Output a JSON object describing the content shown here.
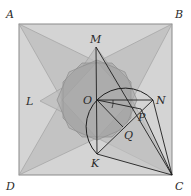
{
  "diagram": {
    "type": "geometry",
    "colors": {
      "square_fill": "#cfcfcf",
      "square_stroke": "#8a8a8a",
      "star_fill": "#b8b8b8",
      "octagon_fill": "#9e9e9e",
      "line": "#1e1e1e",
      "thin_line": "#7a7a7a"
    },
    "points": {
      "A": {
        "label": "A",
        "x": 19,
        "y": 24
      },
      "B": {
        "label": "B",
        "x": 172,
        "y": 24
      },
      "C": {
        "label": "C",
        "x": 172,
        "y": 175
      },
      "D": {
        "label": "D",
        "x": 19,
        "y": 175
      },
      "M": {
        "label": "M",
        "x": 96,
        "y": 47
      },
      "N": {
        "label": "N",
        "x": 153,
        "y": 100
      },
      "K": {
        "label": "K",
        "x": 97,
        "y": 154
      },
      "L": {
        "label": "L",
        "x": 40,
        "y": 101
      },
      "O": {
        "label": "O",
        "x": 97,
        "y": 100
      },
      "P": {
        "label": "P",
        "x": 141,
        "y": 109
      },
      "Q": {
        "label": "Q",
        "x": 123,
        "y": 127
      }
    },
    "segments": [
      [
        "M",
        "K"
      ],
      [
        "O",
        "N"
      ],
      [
        "O",
        "P"
      ],
      [
        "O",
        "Q"
      ],
      [
        "M",
        "C"
      ],
      [
        "K",
        "N"
      ],
      [
        "K",
        "C"
      ],
      [
        "N",
        "C"
      ],
      [
        "P",
        "C"
      ]
    ],
    "arc": {
      "from": "N",
      "to": "K",
      "through": "top-left",
      "label": "semicircle"
    }
  }
}
